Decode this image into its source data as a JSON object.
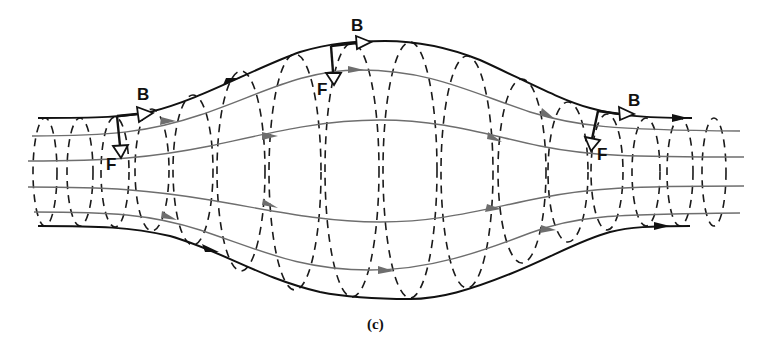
{
  "figure": {
    "caption": "(c)",
    "caption_letter": "c",
    "labels": {
      "field_label": "B",
      "force_label": "F"
    },
    "annotations": [
      {
        "id": "left",
        "field": "B",
        "force": "F"
      },
      {
        "id": "top",
        "field": "B",
        "force": "F"
      },
      {
        "id": "right",
        "field": "B",
        "force": "F"
      }
    ],
    "colors": {
      "boundary_line": "#111111",
      "inner_streamline": "#6e6e6e",
      "dashed_loop": "#1a1a1a",
      "background": "#ffffff"
    },
    "streamline_count": 6,
    "loop_count": 14
  }
}
